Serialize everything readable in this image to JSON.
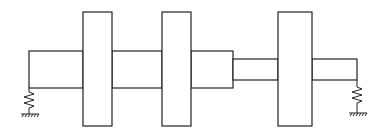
{
  "diagram": {
    "title": "",
    "components": [
      {
        "type": "spring-support",
        "name": "left-support"
      },
      {
        "type": "shaft-segment",
        "name": "shaft-segment-1",
        "diameter": "large"
      },
      {
        "type": "disk",
        "name": "disk-1"
      },
      {
        "type": "shaft-segment",
        "name": "shaft-segment-2",
        "diameter": "large"
      },
      {
        "type": "disk",
        "name": "disk-2"
      },
      {
        "type": "shaft-segment",
        "name": "shaft-segment-3",
        "diameter": "large"
      },
      {
        "type": "shaft-segment",
        "name": "shaft-segment-4",
        "diameter": "small"
      },
      {
        "type": "disk",
        "name": "disk-3"
      },
      {
        "type": "shaft-segment",
        "name": "shaft-segment-5",
        "diameter": "small"
      },
      {
        "type": "spring-support",
        "name": "right-support"
      }
    ],
    "colors": {
      "stroke": "#222222",
      "background": "#ffffff"
    }
  }
}
